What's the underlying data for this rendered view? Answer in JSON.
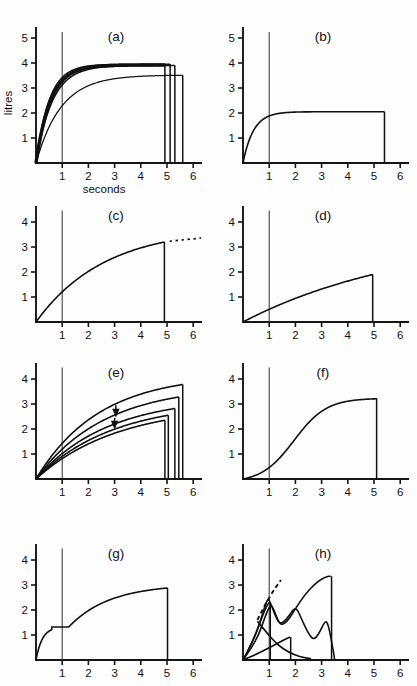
{
  "figure": {
    "background_color": "#fdfdfd",
    "ink_color": "#101010",
    "panel_count": 8
  },
  "axes": {
    "xlabel": "seconds",
    "ylabel": "litres",
    "xticks": [
      "1",
      "2",
      "3",
      "4",
      "5",
      "6"
    ],
    "xtick_values": [
      1,
      2,
      3,
      4,
      5,
      6
    ],
    "yticks_full": [
      "1",
      "2",
      "3",
      "4",
      "5"
    ],
    "yticks_short": [
      "1",
      "2",
      "3",
      "4"
    ],
    "xlim": [
      0,
      6.3
    ],
    "ylim_full": [
      0,
      5.4
    ],
    "ylim_short": [
      0,
      4.6
    ]
  },
  "panels": [
    {
      "id": "a",
      "label": "(a)",
      "row": 0,
      "col": 0,
      "show_ylabel": true,
      "show_xlabel": true,
      "ytick_set": "full",
      "ref_line_x": 1,
      "description": "several near-identical fast-rising volume-time curves plateauing near 4 litres with terminal vertical drops",
      "curves": [
        {
          "name": "bundle-upper",
          "style": "thick",
          "plateau": 3.92,
          "rise_tau": 0.55,
          "end_x": 4.92,
          "drop": true
        },
        {
          "name": "bundle-upper-2",
          "style": "normal",
          "plateau": 3.95,
          "rise_tau": 0.5,
          "end_x": 5.12,
          "drop": true
        },
        {
          "name": "bundle-upper-3",
          "style": "normal",
          "plateau": 3.9,
          "rise_tau": 0.62,
          "end_x": 5.3,
          "drop": true
        },
        {
          "name": "lower-curve",
          "style": "thin",
          "plateau": 3.52,
          "rise_tau": 0.95,
          "end_x": 5.6,
          "drop": true
        }
      ]
    },
    {
      "id": "b",
      "label": "(b)",
      "row": 0,
      "col": 1,
      "show_ylabel": false,
      "show_xlabel": false,
      "ytick_set": "full",
      "ref_line_x": 1,
      "description": "single curve rising quickly to a flat plateau at 2 litres, ending with a vertical drop at 5.4 s",
      "curves": [
        {
          "name": "single-curve",
          "style": "normal",
          "plateau": 2.05,
          "rise_tau": 0.4,
          "end_x": 5.4,
          "drop": true
        }
      ]
    },
    {
      "id": "c",
      "label": "(c)",
      "row": 1,
      "col": 0,
      "show_ylabel": false,
      "show_xlabel": false,
      "ytick_set": "short",
      "ref_line_x": 1,
      "description": "slowly rising curve reaching 3.2 litres at 4.9 s with a dotted extrapolation continuing to the right",
      "curves": [
        {
          "name": "slow-rise-curve",
          "style": "normal",
          "plateau": 3.6,
          "rise_tau": 2.6,
          "end_x": 4.9,
          "end_y": 3.2,
          "drop": true,
          "dotted_extension": {
            "from_x": 5.1,
            "to_x": 6.3,
            "from_y": 3.23,
            "to_y": 3.36
          }
        }
      ]
    },
    {
      "id": "d",
      "label": "(d)",
      "row": 1,
      "col": 1,
      "show_ylabel": false,
      "show_xlabel": false,
      "ytick_set": "short",
      "ref_line_x": 1,
      "description": "very slow almost linear rise reaching only 1.9 litres at 5 s, then a vertical drop",
      "curves": [
        {
          "name": "very-slow-curve",
          "style": "normal",
          "plateau": 3.1,
          "rise_tau": 6.5,
          "end_x": 4.95,
          "end_y": 1.9,
          "drop": true
        }
      ]
    },
    {
      "id": "e",
      "label": "(e)",
      "row": 2,
      "col": 0,
      "show_ylabel": false,
      "show_xlabel": false,
      "ytick_set": "short",
      "ref_line_x": 1,
      "description": "family of five progressively lower slowly-rising curves with two downward arrows marking the lower pair",
      "curves": [
        {
          "name": "curve-1-highest",
          "style": "normal",
          "plateau": 4.4,
          "rise_tau": 2.4,
          "end_x": 5.6,
          "end_y": 3.78,
          "drop": true
        },
        {
          "name": "curve-2",
          "style": "normal",
          "plateau": 3.9,
          "rise_tau": 2.6,
          "end_x": 5.45,
          "end_y": 3.28,
          "drop": true
        },
        {
          "name": "curve-3",
          "style": "normal",
          "plateau": 3.35,
          "rise_tau": 2.7,
          "end_x": 5.3,
          "end_y": 2.82,
          "drop": true
        },
        {
          "name": "curve-4",
          "style": "normal",
          "plateau": 3.1,
          "rise_tau": 2.9,
          "end_x": 5.05,
          "end_y": 2.55,
          "drop": true
        },
        {
          "name": "curve-5-lowest",
          "style": "normal",
          "plateau": 2.9,
          "rise_tau": 3.1,
          "end_x": 4.92,
          "end_y": 2.35,
          "drop": true
        }
      ],
      "arrows": [
        {
          "name": "arrow-upper",
          "x": 3.05,
          "y_from": 2.95,
          "y_to": 2.62
        },
        {
          "name": "arrow-lower",
          "x": 3.0,
          "y_from": 2.45,
          "y_to": 2.14
        }
      ]
    },
    {
      "id": "f",
      "label": "(f)",
      "row": 2,
      "col": 1,
      "show_ylabel": false,
      "show_xlabel": false,
      "ytick_set": "short",
      "ref_line_x": 1,
      "description": "sigmoid curve with a delayed slow start, steep middle and plateau at 3.2 litres ending at 5.1 s",
      "curves": [
        {
          "name": "sigmoid-curve",
          "style": "normal",
          "plateau": 3.23,
          "sigmoid_center": 1.95,
          "sigmoid_width": 0.62,
          "end_x": 5.1,
          "drop": true
        }
      ]
    },
    {
      "id": "g",
      "label": "(g)",
      "row": 3,
      "col": 0,
      "show_ylabel": false,
      "show_xlabel": false,
      "ytick_set": "short",
      "ref_line_x": 1,
      "description": "curve rising to a 1.3 litre step plateau near 0.6-1.2 s then resuming a slow rise to 2.9 litres at 5 s",
      "curves": [
        {
          "name": "step-plateau-curve",
          "style": "normal",
          "step_level": 1.32,
          "step_start_x": 0.6,
          "step_end_x": 1.25,
          "plateau": 3.1,
          "end_x": 5.02,
          "end_y": 2.88,
          "drop": true
        }
      ]
    },
    {
      "id": "h",
      "label": "(h)",
      "row": 3,
      "col": 1,
      "show_ylabel": false,
      "show_xlabel": false,
      "ytick_set": "short",
      "ref_line_x": 1,
      "description": "several erratic cough-artefact curves with sharp peaks, dips and oscillations, plus a dashed extrapolation rising past 3 litres",
      "curves": [
        {
          "name": "erratic-curve-main",
          "style": "normal",
          "peak1_x": 1.05,
          "peak1_y": 2.18,
          "dip_x": 1.35,
          "dip_y": 1.3,
          "peak2_x": 3.3,
          "peak2_y": 3.35,
          "end_x": 3.42,
          "drop": true
        },
        {
          "name": "erratic-curve-mid",
          "style": "normal",
          "peak1_x": 0.92,
          "peak1_y": 2.45,
          "peak2_x": 2.0,
          "peak2_y": 2.1,
          "dip_x": 2.65,
          "dip_y": 0.78,
          "peak3_x": 3.15,
          "peak3_y": 1.55,
          "end_x": 3.38,
          "drop": true
        },
        {
          "name": "erratic-curve-low",
          "style": "normal",
          "peak_x": 1.8,
          "peak_y": 0.92,
          "end_x": 1.85,
          "drop": true
        },
        {
          "name": "erratic-curve-steep",
          "style": "normal",
          "peak_x": 1.02,
          "peak_y": 2.3,
          "end_x": 1.05,
          "drop": true
        }
      ],
      "dashed_extrapolation": {
        "name": "dashed-extrapolation",
        "from_x": 0.55,
        "from_y": 1.6,
        "to_x": 1.45,
        "to_y": 3.2
      }
    }
  ]
}
